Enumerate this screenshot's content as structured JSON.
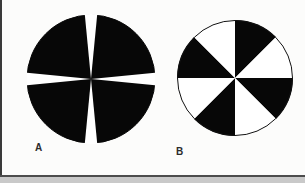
{
  "page": {
    "background_color": "#fcfcfb",
    "border_color": "#3a3a3a",
    "bottom_band_color": "#c9c9c9",
    "width": 305,
    "height": 183
  },
  "figures": [
    {
      "id": "A",
      "label": "A",
      "shape": "disk",
      "description": "Black disk with four narrow white triangular wedges arranged as a cross",
      "center_x": 64,
      "center_y": 65,
      "radius": 64,
      "fill_color": "#070707",
      "wedge_color": "#ffffff",
      "outline_color": "#070707",
      "wedge_count": 4,
      "wedge_angular_width_deg": 11,
      "wedge_center_angles_deg": [
        0,
        90,
        180,
        270
      ],
      "wedge_taper": "point at centre, widest at rim"
    },
    {
      "id": "B",
      "label": "B",
      "shape": "disk",
      "description": "Circle divided into eight equal sectors alternating black and white",
      "center_x": 59,
      "center_y": 59,
      "radius": 58,
      "outline_color": "#111111",
      "outline_width": 1,
      "sector_count": 8,
      "sector_angular_width_deg": 45,
      "sector_colors": [
        "#070707",
        "#ffffff",
        "#070707",
        "#ffffff",
        "#070707",
        "#ffffff",
        "#070707",
        "#ffffff"
      ],
      "first_sector_start_deg": 270,
      "first_sector_color": "#ffffff",
      "note": "boundary is vertical at top centre; left of vertical is black, right is white"
    }
  ],
  "chart_data": {
    "type": "pie",
    "title": "",
    "xlabel": "",
    "ylabel": "",
    "legend": "none",
    "grid": false,
    "panels": [
      {
        "name": "A",
        "slice_labels": [
          "black",
          "white",
          "black",
          "white",
          "black",
          "white",
          "black",
          "white"
        ],
        "values": [
          79,
          11,
          79,
          11,
          79,
          11,
          79,
          11
        ],
        "colors": [
          "#070707",
          "#ffffff",
          "#070707",
          "#ffffff",
          "#070707",
          "#ffffff",
          "#070707",
          "#ffffff"
        ],
        "units": "degrees",
        "total_degrees": 360
      },
      {
        "name": "B",
        "slice_labels": [
          "white",
          "black",
          "white",
          "black",
          "white",
          "black",
          "white",
          "black"
        ],
        "values": [
          45,
          45,
          45,
          45,
          45,
          45,
          45,
          45
        ],
        "colors": [
          "#ffffff",
          "#070707",
          "#ffffff",
          "#070707",
          "#ffffff",
          "#070707",
          "#ffffff",
          "#070707"
        ],
        "units": "degrees",
        "total_degrees": 360
      }
    ]
  }
}
